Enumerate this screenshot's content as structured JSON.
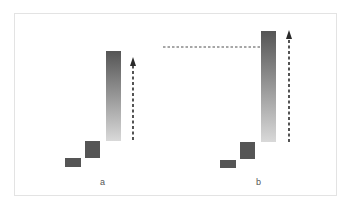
{
  "diagram": {
    "panels": [
      {
        "label": "a",
        "small_block": {
          "x": 65,
          "y": 158,
          "w": 16,
          "h": 9
        },
        "medium_block": {
          "x": 85,
          "y": 141,
          "w": 15,
          "h": 17
        },
        "tall_bar": {
          "x": 106,
          "y": 51,
          "w": 15,
          "h": 90
        },
        "arrow": {
          "x": 133,
          "y_start": 140,
          "y_end": 57
        },
        "label_pos": {
          "x": 100,
          "y": 177
        }
      },
      {
        "label": "b",
        "small_block": {
          "x": 220,
          "y": 160,
          "w": 16,
          "h": 8
        },
        "medium_block": {
          "x": 240,
          "y": 142,
          "w": 15,
          "h": 17
        },
        "tall_bar": {
          "x": 261,
          "y": 31,
          "w": 15,
          "h": 111
        },
        "arrow": {
          "x": 289,
          "y_start": 142,
          "y_end": 30
        },
        "label_pos": {
          "x": 256,
          "y": 177
        }
      }
    ],
    "reference_line": {
      "x1": 163,
      "x2": 261,
      "y": 47
    },
    "colors": {
      "block": "#555555",
      "bar_top": "#555555",
      "bar_bottom": "#d9d9d9",
      "arrow": "#2a2a2a",
      "frame": "#e3e3e3",
      "label": "#555555"
    }
  }
}
